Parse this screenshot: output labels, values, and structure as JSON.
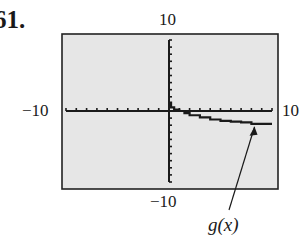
{
  "problem": {
    "number": "61."
  },
  "axes": {
    "xmin_label": "−10",
    "xmax_label": "10",
    "ymax_label": "10",
    "ymin_label": "−10"
  },
  "annotation": {
    "label": "g(x)"
  },
  "colors": {
    "screen_bg": "#e6e6e6",
    "ink": "#1a1a1a",
    "frame": "#222222"
  },
  "chart_data": {
    "type": "line",
    "title": "",
    "xlabel": "",
    "ylabel": "",
    "xlim": [
      -10,
      10
    ],
    "ylim": [
      -10,
      10
    ],
    "grid": false,
    "legend": null,
    "tick_spacing": 1,
    "annotations": [
      {
        "text": "g(x)",
        "points_to": [
          8.5,
          -1.8
        ]
      }
    ],
    "series": [
      {
        "name": "g(x)",
        "x": [
          0.05,
          0.2,
          0.5,
          1,
          1.5,
          2,
          3,
          4,
          5,
          6,
          7,
          8,
          9,
          10
        ],
        "y": [
          1.2,
          0.5,
          0.2,
          0,
          -0.3,
          -0.6,
          -0.9,
          -1.2,
          -1.4,
          -1.5,
          -1.6,
          -1.8,
          -1.8,
          -1.8
        ]
      }
    ]
  }
}
